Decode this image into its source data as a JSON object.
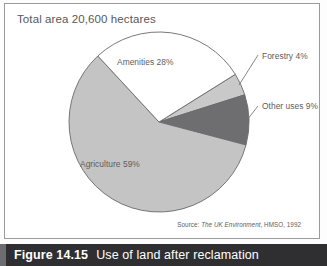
{
  "figure": {
    "caption_number": "Figure 14.15",
    "caption_text": "Use of land after reclamation"
  },
  "source": {
    "label": "Source: ",
    "title": "The UK Environment",
    "rest": ", HMSO, 1992"
  },
  "chart_data": {
    "type": "pie",
    "title": "Total area 20,600 hectares",
    "total_label": "Total area 20,600 hectares",
    "total_value": 20600,
    "units": "hectares",
    "categories": [
      "Forestry",
      "Other uses",
      "Agriculture",
      "Amenities"
    ],
    "values": [
      4,
      9,
      59,
      28
    ],
    "value_unit": "%",
    "labels": [
      "Forestry 4%",
      "Other uses 9%",
      "Agriculture 59%",
      "Amenities 28%"
    ],
    "colors": [
      "#c9c9c9",
      "#6e6e70",
      "#c4c4c4",
      "#ffffff"
    ],
    "slice_edge_color": "#6a6a6a",
    "legend": "none",
    "grid": false,
    "start_angle_deg": -32,
    "direction": "clockwise",
    "slices": [
      {
        "name": "Forestry",
        "value": 4,
        "label": "Forestry 4%",
        "color": "#c9c9c9",
        "label_position": "outside-right"
      },
      {
        "name": "Other uses",
        "value": 9,
        "label": "Other uses 9%",
        "color": "#6e6e70",
        "label_position": "outside-right"
      },
      {
        "name": "Agriculture",
        "value": 59,
        "label": "Agriculture 59%",
        "color": "#c4c4c4",
        "label_position": "inside"
      },
      {
        "name": "Amenities",
        "value": 28,
        "label": "Amenities 28%",
        "color": "#ffffff",
        "label_position": "inside"
      }
    ]
  },
  "colors": {
    "panel_border": "#9b9b9b",
    "caption_bar": "#2f2f31",
    "caption_accent": "#6d6d70",
    "text": "#5d5d5f"
  }
}
